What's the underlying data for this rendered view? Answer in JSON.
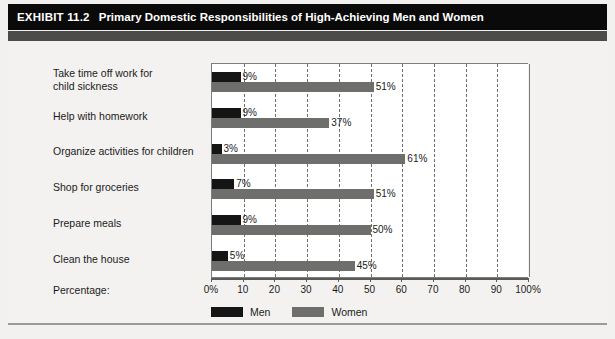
{
  "exhibit": {
    "label": "EXHIBIT 11.2",
    "title": "Primary Domestic Responsibilities of High-Achieving Men and Women"
  },
  "axis": {
    "caption": "Percentage:"
  },
  "colors": {
    "men": "#151515",
    "women": "#6e6e6c",
    "header_band": "#0a0a0a",
    "subheader_band": "#4b4b4b",
    "page_background": "#f2f1ef",
    "plot_background": "#ffffff"
  },
  "chart_data": {
    "type": "bar",
    "orientation": "horizontal",
    "title": "Primary Domestic Responsibilities of High-Achieving Men and Women",
    "xlabel": "Percentage:",
    "ylabel": "",
    "xlim": [
      0,
      100
    ],
    "grid": true,
    "legend_position": "bottom",
    "categories": [
      "Take time off work for child sickness",
      "Help with homework",
      "Organize activities for children",
      "Shop for groceries",
      "Prepare meals",
      "Clean the house"
    ],
    "category_lines": [
      [
        "Take time off work for",
        "child sickness"
      ],
      [
        "Help with homework"
      ],
      [
        "Organize activities for children"
      ],
      [
        "Shop for groceries"
      ],
      [
        "Prepare meals"
      ],
      [
        "Clean the house"
      ]
    ],
    "series": [
      {
        "name": "Men",
        "values": [
          9,
          9,
          3,
          7,
          9,
          5
        ],
        "labels": [
          "9%",
          "9%",
          "3%",
          "7%",
          "9%",
          "5%"
        ],
        "color": "#151515"
      },
      {
        "name": "Women",
        "values": [
          51,
          37,
          61,
          51,
          50,
          45
        ],
        "labels": [
          "51%",
          "37%",
          "61%",
          "51%",
          "50%",
          "45%"
        ],
        "color": "#6e6e6c"
      }
    ],
    "xticks": [
      0,
      10,
      20,
      30,
      40,
      50,
      60,
      70,
      80,
      90,
      100
    ],
    "xtick_labels": [
      "0%",
      "10",
      "20",
      "30",
      "40",
      "50",
      "60",
      "70",
      "80",
      "90",
      "100%"
    ]
  }
}
